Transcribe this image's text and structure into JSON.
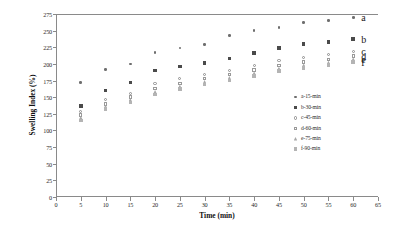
{
  "chart_data": {
    "type": "scatter",
    "title": "",
    "xlabel": "Time (min)",
    "ylabel": "Swelling Index (%)",
    "xlim": [
      0,
      65
    ],
    "ylim": [
      0,
      275
    ],
    "xticks": [
      0,
      5,
      10,
      15,
      20,
      25,
      30,
      35,
      40,
      45,
      50,
      55,
      60,
      65
    ],
    "yticks": [
      0,
      25,
      50,
      75,
      100,
      125,
      150,
      175,
      200,
      225,
      250,
      275
    ],
    "grid": false,
    "legend_position": "inside-right",
    "x": [
      5,
      10,
      15,
      20,
      25,
      30,
      35,
      40,
      45,
      50,
      55,
      60
    ],
    "series": [
      {
        "name": "a-15-min",
        "key": "a",
        "end_label": "a",
        "marker": "small-filled-circle",
        "color": "#6e6e6e",
        "values": [
          172,
          192,
          200,
          217,
          224,
          229,
          243,
          250,
          255,
          262,
          265,
          270
        ]
      },
      {
        "name": "b-30-min",
        "key": "b",
        "end_label": "b",
        "marker": "filled-square",
        "color": "#4a4a4a",
        "values": [
          137,
          160,
          172,
          190,
          196,
          201,
          208,
          216,
          224,
          230,
          233,
          237
        ]
      },
      {
        "name": "c-45-min",
        "key": "c",
        "end_label": "c",
        "marker": "open-circle",
        "color": "#8d8d8d",
        "values": [
          128,
          146,
          156,
          170,
          178,
          184,
          190,
          198,
          205,
          210,
          214,
          219
        ]
      },
      {
        "name": "d-60-min",
        "key": "d",
        "end_label": "d",
        "marker": "open-square",
        "color": "#9a9a9a",
        "values": [
          123,
          140,
          150,
          163,
          171,
          178,
          184,
          191,
          198,
          203,
          207,
          212
        ]
      },
      {
        "name": "e-75-min",
        "key": "e",
        "end_label": "e",
        "marker": "filled-triangle",
        "color": "#a8a8a8",
        "values": [
          119,
          136,
          146,
          158,
          166,
          173,
          179,
          186,
          193,
          198,
          202,
          207
        ]
      },
      {
        "name": "f-90-min",
        "key": "f",
        "end_label": "f",
        "marker": "light-square",
        "color": "#b4b4b4",
        "values": [
          115,
          132,
          142,
          154,
          162,
          169,
          175,
          182,
          189,
          194,
          198,
          203
        ]
      }
    ]
  },
  "legend": {
    "items": [
      {
        "label": "a-15-min",
        "key": "a"
      },
      {
        "label": "b-30-min",
        "key": "b"
      },
      {
        "label": "c-45-min",
        "key": "c"
      },
      {
        "label": "d-60-min",
        "key": "d"
      },
      {
        "label": "e-75-min",
        "key": "e"
      },
      {
        "label": "f-90-min",
        "key": "f"
      }
    ]
  }
}
